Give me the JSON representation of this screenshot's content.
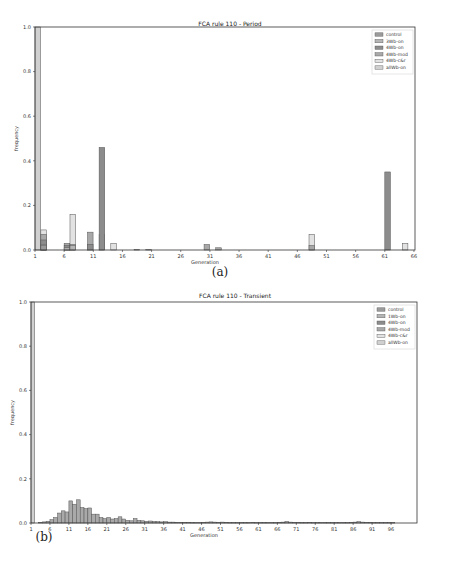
{
  "page": {
    "page_number_fragment": ""
  },
  "charts": [
    {
      "title": "FCA rule 110 - Period",
      "xlabel": "Generation",
      "ylabel": "frequency",
      "caption": "(a)",
      "xticks": [
        "1",
        "6",
        "11",
        "16",
        "21",
        "26",
        "31",
        "36",
        "41",
        "46",
        "51",
        "56",
        "61",
        "66"
      ],
      "yticks": [
        "0.0",
        "0.2",
        "0.4",
        "0.6",
        "0.8",
        "1.0"
      ],
      "legend": [
        "control",
        "3Wb-on",
        "4Wb-on",
        "4Wb-mod",
        "4Wb-c&r",
        "allWb-on"
      ]
    },
    {
      "title": "FCA rule 110 - Transient",
      "xlabel": "Generation",
      "ylabel": "frequency",
      "caption": "(b)",
      "xticks": [
        "1",
        "6",
        "11",
        "16",
        "21",
        "26",
        "31",
        "36",
        "41",
        "46",
        "51",
        "56",
        "61",
        "66",
        "71",
        "76",
        "81",
        "86",
        "91",
        "96"
      ],
      "yticks": [
        "0.0",
        "0.2",
        "0.4",
        "0.6",
        "0.8",
        "1.0"
      ],
      "legend": [
        "control",
        "1Wb-on",
        "4Wb-on",
        "4Wb-mod",
        "4Wb-c&r",
        "allWb-on"
      ]
    }
  ],
  "colors": {
    "control": "#9a9a9a",
    "wb_on_small": "#b5b5b5",
    "wb4_on": "#8c8c8c",
    "wb4_mod": "#a8a8a8",
    "wb4_cr": "#e2e2e2",
    "allwb_on": "#d0d0d0",
    "edge": "#555555"
  },
  "chart_data": [
    {
      "type": "bar",
      "title": "FCA rule 110 - Period",
      "xlabel": "Generation",
      "ylabel": "frequency",
      "xlim": [
        1,
        66
      ],
      "ylim": [
        0,
        1.0
      ],
      "grid": false,
      "legend_position": "upper right",
      "stacked_overlay": true,
      "series": [
        {
          "name": "allWb-on",
          "points": [
            [
              1,
              1.0
            ]
          ]
        },
        {
          "name": "4Wb-c&r",
          "points": [
            [
              2,
              0.09
            ],
            [
              7,
              0.16
            ],
            [
              14,
              0.03
            ],
            [
              18,
              0.002
            ],
            [
              20,
              0.002
            ],
            [
              48,
              0.07
            ],
            [
              64,
              0.03
            ]
          ]
        },
        {
          "name": "4Wb-mod",
          "points": [
            [
              2,
              0.07
            ],
            [
              6,
              0.03
            ],
            [
              7,
              0.025
            ],
            [
              10,
              0.08
            ],
            [
              12,
              0.07
            ],
            [
              30,
              0.025
            ],
            [
              32,
              0.01
            ],
            [
              48,
              0.02
            ]
          ]
        },
        {
          "name": "4Wb-on",
          "points": [
            [
              2,
              0.045
            ],
            [
              6,
              0.02
            ],
            [
              10,
              0.025
            ],
            [
              12,
              0.46
            ],
            [
              61,
              0.35
            ]
          ]
        },
        {
          "name": "3Wb-on",
          "points": [
            [
              2,
              0.025
            ],
            [
              6,
              0.01
            ],
            [
              7,
              0.02
            ]
          ]
        },
        {
          "name": "control",
          "points": [
            [
              2,
              0.02
            ]
          ]
        }
      ]
    },
    {
      "type": "bar",
      "title": "FCA rule 110 - Transient",
      "xlabel": "Generation",
      "ylabel": "frequency",
      "xlim": [
        1,
        101
      ],
      "ylim": [
        0,
        1.0
      ],
      "grid": false,
      "legend_position": "upper right",
      "series": [
        {
          "name": "allWb-on",
          "points": [
            [
              1,
              1.0
            ]
          ]
        },
        {
          "name": "combined",
          "points": [
            [
              3,
              0.003
            ],
            [
              4,
              0.005
            ],
            [
              5,
              0.008
            ],
            [
              6,
              0.015
            ],
            [
              7,
              0.025
            ],
            [
              8,
              0.045
            ],
            [
              9,
              0.055
            ],
            [
              10,
              0.05
            ],
            [
              11,
              0.1
            ],
            [
              12,
              0.085
            ],
            [
              13,
              0.105
            ],
            [
              14,
              0.07
            ],
            [
              15,
              0.065
            ],
            [
              16,
              0.068
            ],
            [
              17,
              0.04
            ],
            [
              18,
              0.04
            ],
            [
              19,
              0.025
            ],
            [
              20,
              0.02
            ],
            [
              21,
              0.025
            ],
            [
              22,
              0.018
            ],
            [
              23,
              0.02
            ],
            [
              24,
              0.028
            ],
            [
              25,
              0.018
            ],
            [
              26,
              0.012
            ],
            [
              27,
              0.01
            ],
            [
              28,
              0.02
            ],
            [
              29,
              0.012
            ],
            [
              30,
              0.01
            ],
            [
              31,
              0.008
            ],
            [
              32,
              0.009
            ],
            [
              33,
              0.007
            ],
            [
              34,
              0.006
            ],
            [
              35,
              0.005
            ],
            [
              36,
              0.006
            ],
            [
              37,
              0.004
            ],
            [
              38,
              0.004
            ],
            [
              39,
              0.003
            ],
            [
              40,
              0.003
            ],
            [
              41,
              0.003
            ],
            [
              42,
              0.003
            ],
            [
              43,
              0.002
            ],
            [
              44,
              0.002
            ],
            [
              45,
              0.002
            ],
            [
              46,
              0.003
            ],
            [
              47,
              0.004
            ],
            [
              48,
              0.005
            ],
            [
              49,
              0.004
            ],
            [
              50,
              0.003
            ],
            [
              51,
              0.004
            ],
            [
              52,
              0.003
            ],
            [
              53,
              0.002
            ],
            [
              54,
              0.002
            ],
            [
              55,
              0.002
            ],
            [
              56,
              0.002
            ],
            [
              57,
              0.002
            ],
            [
              58,
              0.002
            ],
            [
              59,
              0.003
            ],
            [
              60,
              0.002
            ],
            [
              61,
              0.002
            ],
            [
              62,
              0.002
            ],
            [
              63,
              0.002
            ],
            [
              64,
              0.002
            ],
            [
              65,
              0.002
            ],
            [
              66,
              0.003
            ],
            [
              67,
              0.004
            ],
            [
              68,
              0.007
            ],
            [
              69,
              0.004
            ],
            [
              70,
              0.003
            ],
            [
              71,
              0.003
            ],
            [
              72,
              0.002
            ],
            [
              73,
              0.002
            ],
            [
              74,
              0.003
            ],
            [
              75,
              0.002
            ],
            [
              76,
              0.002
            ],
            [
              77,
              0.002
            ],
            [
              78,
              0.002
            ],
            [
              79,
              0.002
            ],
            [
              80,
              0.002
            ],
            [
              81,
              0.002
            ],
            [
              82,
              0.002
            ],
            [
              83,
              0.002
            ],
            [
              84,
              0.002
            ],
            [
              85,
              0.003
            ],
            [
              86,
              0.004
            ],
            [
              87,
              0.006
            ],
            [
              88,
              0.004
            ],
            [
              89,
              0.003
            ],
            [
              90,
              0.003
            ],
            [
              91,
              0.002
            ],
            [
              92,
              0.002
            ],
            [
              93,
              0.002
            ],
            [
              94,
              0.002
            ],
            [
              95,
              0.002
            ],
            [
              96,
              0.002
            ]
          ]
        }
      ]
    }
  ]
}
